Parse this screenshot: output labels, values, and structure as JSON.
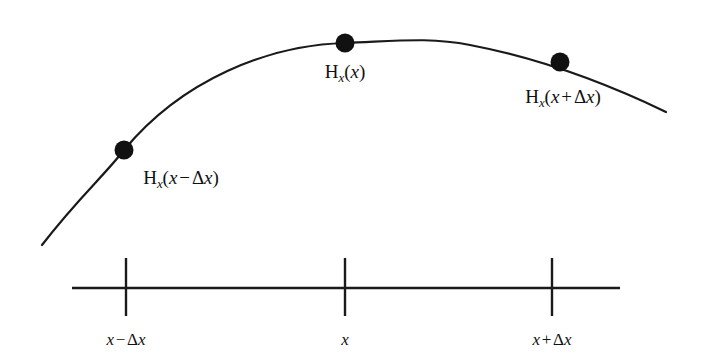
{
  "figure": {
    "type": "line-diagram",
    "background_color": "#ffffff",
    "ink_color": "#111111"
  },
  "curve": {
    "name": "field-curve",
    "stroke_color": "#1a1a1a",
    "stroke_width": 2.2,
    "start_point": [
      42,
      245
    ],
    "end_point": [
      666,
      112
    ],
    "apex_point": [
      432,
      36
    ],
    "path": "M 42 245 C 78 198 104 176 124 150 C 182 80 268 45 345 43 C 398 41 430 37 470 45 C 548 60 612 86 666 112"
  },
  "points": [
    {
      "id": "point-left",
      "label": "H_x(x - dx)",
      "cx": 124,
      "cy": 150,
      "r": 9.5,
      "fill": "#111111"
    },
    {
      "id": "point-center",
      "label": "H_x(x)",
      "cx": 345,
      "cy": 43,
      "r": 9.5,
      "fill": "#111111"
    },
    {
      "id": "point-right",
      "label": "H_x(x + dx)",
      "cx": 560,
      "cy": 62,
      "r": 9.5,
      "fill": "#111111"
    }
  ],
  "curve_labels": {
    "left": {
      "base": "H",
      "subscript": "x",
      "open": "(",
      "arg_var": "x",
      "operator": "−",
      "delta": "Δ",
      "delta_var": "x",
      "close": ")",
      "x": 181,
      "y": 168
    },
    "center": {
      "base": "H",
      "subscript": "x",
      "open": "(",
      "arg_var": "x",
      "operator": "",
      "delta": "",
      "delta_var": "",
      "close": ")",
      "x": 345,
      "y": 62
    },
    "right": {
      "base": "H",
      "subscript": "x",
      "open": "(",
      "arg_var": "x",
      "operator": "+",
      "delta": "Δ",
      "delta_var": "x",
      "close": ")",
      "x": 563,
      "y": 87
    }
  },
  "axis": {
    "name": "x-axis",
    "stroke_color": "#1a1a1a",
    "stroke_width": 2.4,
    "y": 288,
    "x_start": 72,
    "x_end": 620,
    "tick_top": 258,
    "tick_bottom": 316,
    "tick_stroke_width": 2.4,
    "ticks": [
      {
        "id": "tick-x-minus-dx",
        "x": 126,
        "label": {
          "var": "x",
          "operator": "−",
          "delta": "Δ",
          "delta_var": "x"
        },
        "label_y": 331
      },
      {
        "id": "tick-x",
        "x": 345,
        "label": {
          "var": "x",
          "operator": "",
          "delta": "",
          "delta_var": ""
        },
        "label_y": 331
      },
      {
        "id": "tick-x-plus-dx",
        "x": 552,
        "label": {
          "var": "x",
          "operator": "+",
          "delta": "Δ",
          "delta_var": "x"
        },
        "label_y": 331
      }
    ]
  }
}
